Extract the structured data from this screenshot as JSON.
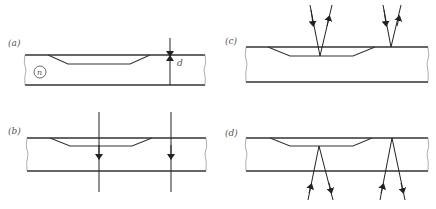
{
  "figure": {
    "panels": [
      {
        "id": "a",
        "label": "(a)",
        "description": "Slab with shallow groove; refractive index n; thickness d dimension"
      },
      {
        "id": "b",
        "label": "(b)",
        "description": "Normal-incidence transmission rays through grooved and ungrooved region"
      },
      {
        "id": "c",
        "label": "(c)",
        "description": "Reflection from groove bottom and from top surface"
      },
      {
        "id": "d",
        "label": "(d)",
        "description": "Reflection from below, at groove bottom and at top surface"
      }
    ],
    "symbols": {
      "index": "n",
      "thickness": "d"
    },
    "colors": {
      "line": "#333333",
      "background": "#ffffff"
    }
  }
}
